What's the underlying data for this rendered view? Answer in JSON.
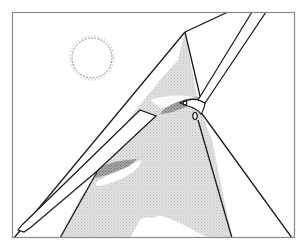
{
  "illustration": {
    "title": "Sailboat mast and sail illustration",
    "caption": "",
    "colors": {
      "background": "#ffffff",
      "frame": "#8a8a8a",
      "line": "#1a1a1a",
      "sail_fill": "#d6d6d6",
      "shadow_fill": "#8f8f8f",
      "sun": "#888888",
      "highlight": "#ffffff"
    },
    "elements": [
      "frame",
      "sun",
      "mast",
      "boom",
      "sail",
      "shadow-patch",
      "rigging-lines",
      "clouds"
    ]
  }
}
